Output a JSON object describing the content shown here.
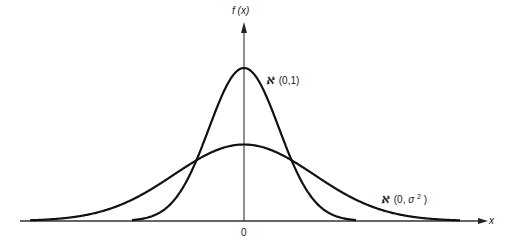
{
  "chart_data": {
    "type": "line",
    "title": "",
    "xlabel": "x",
    "ylabel": "f (x)",
    "x_ticks": [
      "0"
    ],
    "grid": false,
    "legend": "inline labels",
    "series": [
      {
        "name": "ℵ (0,1)",
        "label": "ѧɴ (0,1)",
        "distribution": "normal",
        "mean": 0,
        "variance": 1,
        "relative_peak_height": 1.0
      },
      {
        "name": "ℵ (0,σ²)",
        "label": "ѧɴ (0,σ²)",
        "distribution": "normal",
        "mean": 0,
        "variance": "sigma^2 (σ≈2)",
        "relative_peak_height": 0.5
      }
    ],
    "annotations": [
      "ℵ (0,1)",
      "ℵ (0,σ²)"
    ]
  },
  "labels": {
    "y_axis": "f (x)",
    "x_axis": "x",
    "origin": "0",
    "narrow_curve_script": "ℵ",
    "narrow_curve_params": "(0,1)",
    "wide_curve_script": "ℵ",
    "wide_curve_params_prefix": "(0,",
    "wide_curve_sigma": "σ",
    "wide_curve_exp": "2",
    "wide_curve_params_suffix": ")"
  }
}
